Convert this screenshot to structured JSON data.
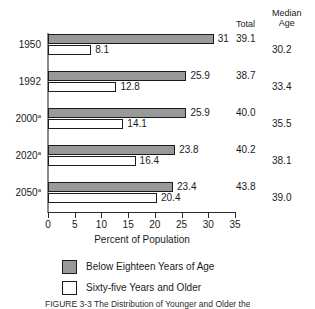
{
  "headers": {
    "total": "Total",
    "median_line1": "Median",
    "median_line2": "Age"
  },
  "axis": {
    "title": "Percent of Population",
    "ticks": [
      "0",
      "5",
      "10",
      "15",
      "20",
      "25",
      "30",
      "35"
    ]
  },
  "legend": {
    "young": "Below Eighteen Years of Age",
    "old": "Sixty-five Years and Older"
  },
  "caption": "FIGURE 3-3   The Distribution of Younger and Older the",
  "colors": {
    "young_fill": "#999999",
    "old_fill": "#ffffff",
    "bar_border": "#1c1c1c",
    "axis": "#2b2b2b"
  },
  "rows": [
    {
      "year": "1950",
      "footnote": "",
      "young": "31",
      "old": "8.1",
      "total": "39.1",
      "median": "30.2"
    },
    {
      "year": "1992",
      "footnote": "",
      "young": "25.9",
      "old": "12.8",
      "total": "38.7",
      "median": "33.4"
    },
    {
      "year": "2000",
      "footnote": "a",
      "young": "25.9",
      "old": "14.1",
      "total": "40.0",
      "median": "35.5"
    },
    {
      "year": "2020",
      "footnote": "a",
      "young": "23.8",
      "old": "16.4",
      "total": "40.2",
      "median": "38.1"
    },
    {
      "year": "2050",
      "footnote": "a",
      "young": "23.4",
      "old": "20.4",
      "total": "43.8",
      "median": "39.0"
    }
  ],
  "chart_data": {
    "type": "bar",
    "orientation": "horizontal",
    "title": "The Distribution of Younger and Older",
    "xlabel": "Percent of Population",
    "ylabel": "",
    "xlim": [
      0,
      35
    ],
    "xticks": [
      0,
      5,
      10,
      15,
      20,
      25,
      30,
      35
    ],
    "grid": false,
    "legend_position": "bottom-left",
    "categories": [
      "1950",
      "1992",
      "2000a",
      "2020a",
      "2050a"
    ],
    "series": [
      {
        "name": "Below Eighteen Years of Age",
        "values": [
          31,
          25.9,
          25.9,
          23.8,
          23.4
        ]
      },
      {
        "name": "Sixty-five Years and Older",
        "values": [
          8.1,
          12.8,
          14.1,
          16.4,
          20.4
        ]
      }
    ],
    "annotations": {
      "Total": [
        39.1,
        38.7,
        40.0,
        40.2,
        43.8
      ],
      "Median Age": [
        30.2,
        33.4,
        35.5,
        38.1,
        39.0
      ]
    },
    "footnote_marker": "a"
  }
}
